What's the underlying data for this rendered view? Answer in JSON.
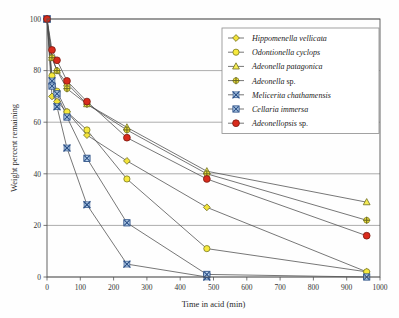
{
  "chart_data": {
    "type": "line",
    "title": "",
    "xlabel": "Time in acid (min)",
    "ylabel": "Weight percent remaining",
    "xlim": [
      0,
      1000
    ],
    "ylim": [
      0,
      100
    ],
    "xticks": [
      0,
      100,
      200,
      300,
      400,
      500,
      600,
      700,
      800,
      900,
      1000
    ],
    "yticks": [
      0,
      20,
      40,
      60,
      80,
      100
    ],
    "grid": "horizontal",
    "legend_position": "top-right",
    "series": [
      {
        "name": "Hippomenella vellicata",
        "italic": true,
        "marker": "diamond",
        "marker_fill": "#f2e23a",
        "marker_stroke": "#6b6b20",
        "x": [
          0,
          15,
          30,
          60,
          120,
          240,
          480,
          960
        ],
        "y": [
          100,
          70,
          68,
          64,
          55,
          45,
          27,
          2
        ]
      },
      {
        "name": "Odontionella cyclops",
        "italic": true,
        "marker": "circle",
        "marker_fill": "#f7e93d",
        "marker_stroke": "#7a7a22",
        "x": [
          0,
          15,
          30,
          60,
          120,
          240,
          480,
          960
        ],
        "y": [
          100,
          78,
          72,
          64,
          57,
          38,
          11,
          2
        ]
      },
      {
        "name": "Adeonella patagonica",
        "italic": true,
        "marker": "triangle",
        "marker_fill": "#f6ec55",
        "marker_stroke": "#6d6d22",
        "x": [
          0,
          15,
          30,
          60,
          120,
          240,
          480,
          960
        ],
        "y": [
          100,
          85,
          80,
          75,
          67,
          58,
          41,
          29
        ]
      },
      {
        "name": "Adeonella sp.",
        "italic_prefix": "Adeonella",
        "suffix": " sp.",
        "marker": "plus",
        "marker_fill": "#f4e43c",
        "marker_stroke": "#6b6b20",
        "x": [
          0,
          15,
          30,
          60,
          120,
          240,
          480,
          960
        ],
        "y": [
          100,
          85,
          80,
          73,
          67,
          57,
          40,
          22
        ]
      },
      {
        "name": "Melicerita chathamensis",
        "italic": true,
        "marker": "x-small",
        "marker_fill": "#bcd6ef",
        "marker_stroke": "#2b4f86",
        "x": [
          0,
          15,
          30,
          60,
          120,
          240,
          480
        ],
        "y": [
          100,
          76,
          66,
          50,
          28,
          5,
          0
        ]
      },
      {
        "name": "Cellaria immersa",
        "italic": true,
        "marker": "x-box",
        "marker_fill": "#bcd6ef",
        "marker_stroke": "#2b4f86",
        "x": [
          0,
          15,
          30,
          60,
          120,
          240,
          480,
          960
        ],
        "y": [
          100,
          74,
          71,
          62,
          46,
          21,
          1,
          0
        ]
      },
      {
        "name": "Adeonellopsis sp.",
        "italic_prefix": "Adeonellopsis",
        "suffix": " sp.",
        "marker": "circle-red",
        "marker_fill": "#d92b1c",
        "marker_stroke": "#7a1a10",
        "x": [
          0,
          15,
          30,
          60,
          120,
          240,
          480,
          960
        ],
        "y": [
          100,
          88,
          84,
          76,
          68,
          54,
          38,
          16
        ]
      }
    ]
  },
  "legend": {
    "entries": [
      {
        "label_italic": "Hippomenella vellicata",
        "label_plain": ""
      },
      {
        "label_italic": "Odontionella cyclops",
        "label_plain": ""
      },
      {
        "label_italic": "Adeonella patagonica",
        "label_plain": ""
      },
      {
        "label_italic": "Adeonella",
        "label_plain": " sp."
      },
      {
        "label_italic": "Melicerita chathamensis",
        "label_plain": ""
      },
      {
        "label_italic": "Cellaria immersa",
        "label_plain": ""
      },
      {
        "label_italic": "Adeonellopsis",
        "label_plain": " sp."
      }
    ]
  },
  "colors": {
    "yellow": "#f2e23a",
    "red": "#d92b1c",
    "blue": "#2b4f86",
    "grid": "#8a8a8a",
    "axis": "#555555"
  }
}
